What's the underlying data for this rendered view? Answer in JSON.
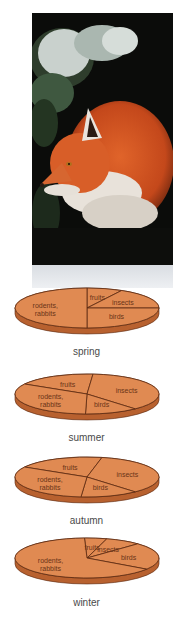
{
  "photo": {
    "subject": "red fox in snowy evergreen forest",
    "icon": "fox-photo"
  },
  "colors": {
    "slice_fill": "#e08a52",
    "slice_side": "#b8612f",
    "slice_line": "#5a2a12",
    "label_text": "#6a3418",
    "season_text": "#4a4a4a"
  },
  "chart_data": [
    {
      "type": "pie",
      "title": "spring",
      "note": "approximate shares read from slice angles; no values printed",
      "categories": [
        "fruits",
        "insects",
        "birds",
        "rodents, rabbits"
      ],
      "values": [
        8,
        17,
        25,
        50
      ]
    },
    {
      "type": "pie",
      "title": "summer",
      "note": "approximate shares read from slice angles; no values printed",
      "categories": [
        "fruits",
        "insects",
        "birds",
        "rodents, rabbits"
      ],
      "values": [
        18,
        37,
        12,
        33
      ]
    },
    {
      "type": "pie",
      "title": "autumn",
      "note": "approximate shares read from slice angles; no values printed",
      "categories": [
        "fruits",
        "insects",
        "birds",
        "rodents, rabbits"
      ],
      "values": [
        20,
        35,
        13,
        32
      ]
    },
    {
      "type": "pie",
      "title": "winter",
      "note": "approximate shares read from slice angles; no values printed",
      "categories": [
        "fruits",
        "insects",
        "birds",
        "rodents, rabbits"
      ],
      "values": [
        5,
        8,
        22,
        65
      ]
    }
  ]
}
